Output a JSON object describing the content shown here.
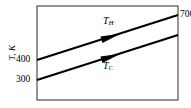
{
  "figure": {
    "background_color": "#ffffff",
    "line_color": "#000000",
    "frame_color": "#4d4d4d"
  },
  "axes": {
    "ylabel": "T, K",
    "ylabel_name": "temperature-axis-label",
    "frame": {
      "left": 37,
      "top": 6,
      "right": 178,
      "bottom": 100
    }
  },
  "ticks": {
    "y": [
      {
        "value": "400",
        "y": 60
      },
      {
        "value": "300",
        "y": 80
      }
    ],
    "right_top": {
      "value": "700",
      "y": 15
    }
  },
  "annotations": {
    "hot": {
      "symbol": "T",
      "subscript": "H",
      "x": 103,
      "y": 20
    },
    "cold": {
      "symbol": "T",
      "subscript": "C",
      "x": 103,
      "y": 64
    }
  },
  "chart_data": {
    "type": "line",
    "title": "",
    "xlabel": "",
    "ylabel": "T, K",
    "grid": false,
    "legend": "inline-annotations",
    "ylim": [
      260,
      760
    ],
    "ytick_labels": [
      "300",
      "400",
      "700"
    ],
    "axis_end_label": "700",
    "series": [
      {
        "name": "T_H",
        "label": "T_H",
        "display_label": "TH",
        "start": {
          "x_px": 37,
          "y_px": 60,
          "value": 400
        },
        "end": {
          "x_px": 178,
          "y_px": 15,
          "value": 700
        },
        "arrow": {
          "x_px": 110,
          "y_px": 37,
          "direction": "right-up"
        },
        "color": "#000000"
      },
      {
        "name": "T_C",
        "label": "T_C",
        "display_label": "TC",
        "start": {
          "x_px": 37,
          "y_px": 80,
          "value": 300
        },
        "end": {
          "x_px": 178,
          "y_px": 35,
          "value": 600
        },
        "arrow": {
          "x_px": 110,
          "y_px": 57,
          "direction": "right-up"
        },
        "color": "#000000"
      }
    ]
  }
}
